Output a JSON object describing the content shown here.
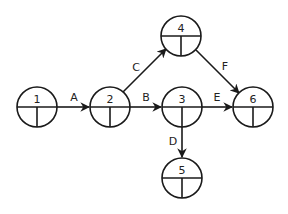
{
  "diagram": {
    "type": "activity-on-arrow network",
    "nodes": [
      {
        "id": "1",
        "label": "1",
        "x": 37,
        "y": 107
      },
      {
        "id": "2",
        "label": "2",
        "x": 110,
        "y": 107
      },
      {
        "id": "3",
        "label": "3",
        "x": 182,
        "y": 107
      },
      {
        "id": "4",
        "label": "4",
        "x": 181,
        "y": 36
      },
      {
        "id": "5",
        "label": "5",
        "x": 182,
        "y": 178
      },
      {
        "id": "6",
        "label": "6",
        "x": 253,
        "y": 107
      }
    ],
    "edges": [
      {
        "label": "A",
        "from": "1",
        "to": "2"
      },
      {
        "label": "B",
        "from": "2",
        "to": "3"
      },
      {
        "label": "C",
        "from": "2",
        "to": "4"
      },
      {
        "label": "D",
        "from": "3",
        "to": "5"
      },
      {
        "label": "E",
        "from": "3",
        "to": "6"
      },
      {
        "label": "F",
        "from": "4",
        "to": "6"
      }
    ],
    "colors": {
      "stroke": "#1a1a1a",
      "background": "#ffffff"
    }
  }
}
